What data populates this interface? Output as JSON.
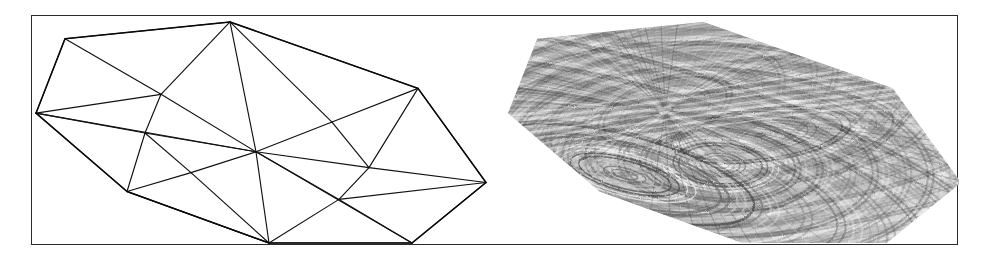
{
  "figure": {
    "caption": "",
    "frame": {
      "x": 31,
      "y": 15,
      "width": 927,
      "height": 230,
      "border_color": "#2b2b2b"
    },
    "background_color": "#ffffff"
  },
  "panels": [
    {
      "id": "wireframe",
      "name": "triangular-mesh-wireframe",
      "label": "",
      "render_style": "wireframe",
      "line_color": "#111111",
      "fill_color": "#ffffff"
    },
    {
      "id": "textured",
      "name": "textured-shaded-surface",
      "label": "",
      "render_style": "grayscale-texture",
      "line_color": "#555555",
      "fill_color": "#b8b8b8"
    }
  ],
  "chart_data": {
    "type": "scatter",
    "title": "",
    "subtitle": "",
    "xlabel": "",
    "ylabel": "",
    "grid": false,
    "legend": "none",
    "xlim": [
      0,
      462
    ],
    "ylim": [
      0,
      230
    ],
    "vertices": [
      {
        "id": "v0",
        "x": 4,
        "y": 98
      },
      {
        "id": "v1",
        "x": 33,
        "y": 23
      },
      {
        "id": "v2",
        "x": 198,
        "y": 6
      },
      {
        "id": "v3",
        "x": 386,
        "y": 73
      },
      {
        "id": "v4",
        "x": 454,
        "y": 168
      },
      {
        "id": "v5",
        "x": 380,
        "y": 229
      },
      {
        "id": "v6",
        "x": 237,
        "y": 229
      },
      {
        "id": "v7",
        "x": 95,
        "y": 177
      },
      {
        "id": "v8",
        "x": 129,
        "y": 79
      },
      {
        "id": "v9",
        "x": 113,
        "y": 118
      },
      {
        "id": "v10",
        "x": 224,
        "y": 137
      },
      {
        "id": "v11",
        "x": 300,
        "y": 107
      },
      {
        "id": "v12",
        "x": 337,
        "y": 153
      },
      {
        "id": "v13",
        "x": 307,
        "y": 185
      },
      {
        "id": "v14",
        "x": 159,
        "y": 158
      }
    ],
    "boundary_loop": [
      "v0",
      "v1",
      "v2",
      "v3",
      "v4",
      "v5",
      "v6",
      "v7"
    ],
    "edges": [
      [
        "v0",
        "v1"
      ],
      [
        "v1",
        "v2"
      ],
      [
        "v2",
        "v3"
      ],
      [
        "v3",
        "v4"
      ],
      [
        "v4",
        "v5"
      ],
      [
        "v5",
        "v6"
      ],
      [
        "v6",
        "v7"
      ],
      [
        "v7",
        "v0"
      ],
      [
        "v1",
        "v8"
      ],
      [
        "v8",
        "v2"
      ],
      [
        "v0",
        "v8"
      ],
      [
        "v0",
        "v9"
      ],
      [
        "v8",
        "v9"
      ],
      [
        "v9",
        "v10"
      ],
      [
        "v8",
        "v10"
      ],
      [
        "v2",
        "v10"
      ],
      [
        "v0",
        "v10"
      ],
      [
        "v2",
        "v11"
      ],
      [
        "v10",
        "v11"
      ],
      [
        "v3",
        "v11"
      ],
      [
        "v11",
        "v12"
      ],
      [
        "v3",
        "v12"
      ],
      [
        "v12",
        "v4"
      ],
      [
        "v10",
        "v12"
      ],
      [
        "v12",
        "v13"
      ],
      [
        "v10",
        "v13"
      ],
      [
        "v13",
        "v4"
      ],
      [
        "v13",
        "v5"
      ],
      [
        "v10",
        "v5"
      ],
      [
        "v10",
        "v6"
      ],
      [
        "v6",
        "v13"
      ],
      [
        "v9",
        "v14"
      ],
      [
        "v14",
        "v10"
      ],
      [
        "v7",
        "v14"
      ],
      [
        "v9",
        "v7"
      ],
      [
        "v14",
        "v6"
      ],
      [
        "v7",
        "v6"
      ]
    ],
    "triangles": [
      [
        "v0",
        "v1",
        "v8"
      ],
      [
        "v1",
        "v2",
        "v8"
      ],
      [
        "v0",
        "v8",
        "v9"
      ],
      [
        "v8",
        "v2",
        "v10"
      ],
      [
        "v8",
        "v10",
        "v9"
      ],
      [
        "v0",
        "v9",
        "v10"
      ],
      [
        "v2",
        "v11",
        "v10"
      ],
      [
        "v2",
        "v3",
        "v11"
      ],
      [
        "v11",
        "v3",
        "v12"
      ],
      [
        "v11",
        "v12",
        "v10"
      ],
      [
        "v3",
        "v4",
        "v12"
      ],
      [
        "v12",
        "v4",
        "v13"
      ],
      [
        "v12",
        "v13",
        "v10"
      ],
      [
        "v13",
        "v4",
        "v5"
      ],
      [
        "v13",
        "v5",
        "v6"
      ],
      [
        "v10",
        "v13",
        "v6"
      ],
      [
        "v9",
        "v14",
        "v10"
      ],
      [
        "v9",
        "v7",
        "v14"
      ],
      [
        "v14",
        "v7",
        "v6"
      ],
      [
        "v14",
        "v6",
        "v10"
      ]
    ],
    "counts": {
      "vertices": 15,
      "edges": 37,
      "triangles": 20
    }
  },
  "texture": {
    "polygon_offset_x": 10,
    "stripe_colors": [
      "#ffffff",
      "#8e8e8e",
      "#5a5a5a",
      "#c9c9c9",
      "#2e2e2e"
    ],
    "pattern": "radial-striped-moire",
    "focus_points": [
      {
        "x": 160,
        "y": 95
      },
      {
        "x": 255,
        "y": 120
      },
      {
        "x": 215,
        "y": 150
      },
      {
        "x": 120,
        "y": 160
      }
    ]
  }
}
